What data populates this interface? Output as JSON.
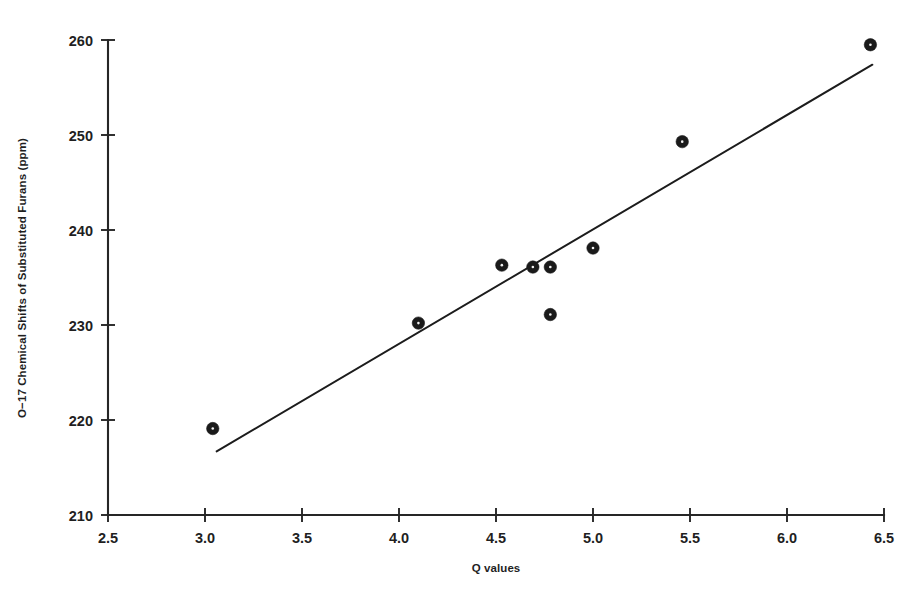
{
  "chart_data": {
    "type": "scatter",
    "title": "",
    "subtitle": "",
    "xlabel": "Q values",
    "ylabel": "O−17 Chemical Shifts of Substituted Furans (ppm)",
    "xlim": [
      2.5,
      6.5
    ],
    "ylim": [
      210,
      260
    ],
    "grid": false,
    "legend": null,
    "x_ticks": [
      "2.5",
      "3.0",
      "3.5",
      "4.0",
      "4.5",
      "5.0",
      "5.5",
      "6.0",
      "6.5"
    ],
    "x_tick_values": [
      2.5,
      3.0,
      3.5,
      4.0,
      4.5,
      5.0,
      5.5,
      6.0,
      6.5
    ],
    "y_ticks": [
      "210",
      "220",
      "230",
      "240",
      "250",
      "260"
    ],
    "y_tick_values": [
      210,
      220,
      230,
      240,
      250,
      260
    ],
    "series": [
      {
        "name": "Substituted furans",
        "marker": "filled-circle",
        "color": "#1a1a1a",
        "points": [
          {
            "x": 3.04,
            "y": 219.1
          },
          {
            "x": 4.1,
            "y": 230.2
          },
          {
            "x": 4.53,
            "y": 236.3
          },
          {
            "x": 4.69,
            "y": 236.1
          },
          {
            "x": 4.78,
            "y": 236.1
          },
          {
            "x": 4.78,
            "y": 231.1
          },
          {
            "x": 5.0,
            "y": 238.1
          },
          {
            "x": 5.46,
            "y": 249.3
          },
          {
            "x": 6.43,
            "y": 259.5
          }
        ]
      }
    ],
    "trend_line": {
      "name": "least-squares fit",
      "color": "#1c1c1c",
      "x_start": 3.06,
      "y_start": 216.7,
      "x_end": 6.44,
      "y_end": 257.4
    }
  },
  "axes": {
    "x_axis_label": "Q values",
    "y_axis_label": "O−17 Chemical Shifts of Substituted Furans (ppm)"
  }
}
